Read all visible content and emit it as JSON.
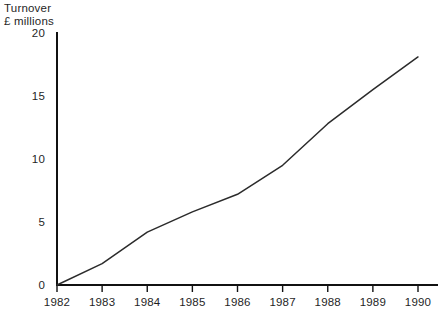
{
  "chart_data": {
    "type": "line",
    "title": "",
    "subtitle": "",
    "ylabel_lines": [
      "Turnover",
      "£ millions"
    ],
    "xlabel": "",
    "ylabel": "Turnover £ millions",
    "categories": [
      "1982",
      "1983",
      "1984",
      "1985",
      "1986",
      "1987",
      "1988",
      "1989",
      "1990"
    ],
    "x": [
      1982,
      1983,
      1984,
      1985,
      1986,
      1987,
      1988,
      1989,
      1990
    ],
    "values": [
      0,
      1.7,
      4.2,
      5.8,
      7.2,
      9.5,
      12.8,
      15.5,
      18.1
    ],
    "series": [
      {
        "name": "Turnover",
        "values": [
          0,
          1.7,
          4.2,
          5.8,
          7.2,
          9.5,
          12.8,
          15.5,
          18.1
        ]
      }
    ],
    "yticks": [
      0,
      5,
      10,
      15,
      20
    ],
    "ytick_labels": [
      "0",
      "5",
      "10",
      "15",
      "20"
    ],
    "xtick_labels": [
      "1982",
      "1983",
      "1984",
      "1985",
      "1986",
      "1987",
      "1988",
      "1989",
      "1990"
    ],
    "ylim": [
      0,
      20
    ],
    "xlim": [
      1982,
      1990
    ],
    "grid": false,
    "legend": false,
    "legend_position": "none",
    "units": "£ millions",
    "line_color": "#2b2b2b",
    "axis_color": "#111111",
    "background_color": "#ffffff",
    "annotations": []
  },
  "layout": {
    "plot_left": 57,
    "plot_right": 418,
    "plot_top": 33,
    "plot_bottom": 285,
    "tick_length": 7
  }
}
